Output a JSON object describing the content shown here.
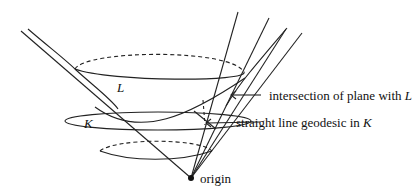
{
  "diagram": {
    "type": "geometric-figure",
    "labels": {
      "L": "L",
      "K": "K",
      "intersection_prefix": "intersection of plane with ",
      "intersection_var": "L",
      "geodesic_prefix": "straight line geodesic in ",
      "geodesic_var": "K",
      "origin": "origin"
    },
    "colors": {
      "stroke": "#222222",
      "background": "#ffffff"
    }
  }
}
